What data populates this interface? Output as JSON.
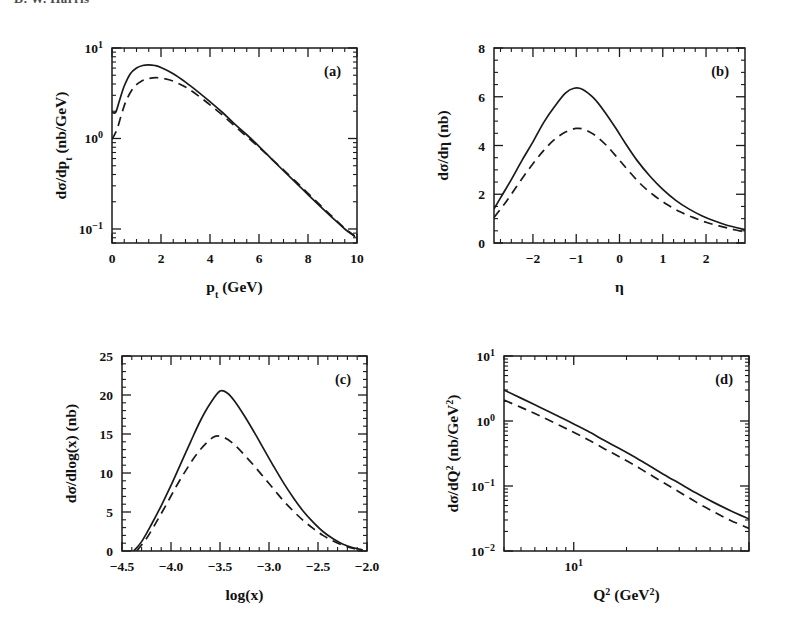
{
  "document": {
    "running_header": "D. W. Harris",
    "background_color": "#ffffff",
    "ink_color": "#1a1a1a"
  },
  "figure": {
    "panel_count": 4,
    "legend_note": "solid and dashed curves"
  },
  "chart_data": [
    {
      "id": "panel-a",
      "tag": "(a)",
      "type": "line",
      "title": "",
      "xlabel": "p_t (GeV)",
      "xlabel_parts": {
        "base": "p",
        "sub": "t",
        "unit": "(GeV)"
      },
      "ylabel": "dσ/dp_t (nb/GeV)",
      "ylabel_parts": {
        "base": "dσ/dp",
        "sub": "t",
        "unit": "(nb/GeV)"
      },
      "xscale": "linear",
      "yscale": "log",
      "xlim": [
        0,
        10
      ],
      "ylim": [
        0.07,
        10
      ],
      "xticks": [
        0,
        2,
        4,
        6,
        8,
        10
      ],
      "xticklabels": [
        "0",
        "2",
        "4",
        "6",
        "8",
        "10"
      ],
      "xminor_step": 0.5,
      "yticks": [
        10,
        1,
        0.1
      ],
      "yticklabels": [
        "10¹",
        "10⁰",
        "10⁻¹"
      ],
      "grid": false,
      "legend": "none",
      "series": [
        {
          "name": "solid",
          "style": "solid",
          "x": [
            0.0,
            0.15,
            0.3,
            0.5,
            0.75,
            1.0,
            1.25,
            1.5,
            1.75,
            2.0,
            2.5,
            3.0,
            3.5,
            4.0,
            4.5,
            5.0,
            5.5,
            6.0,
            6.5,
            7.0,
            7.5,
            8.0,
            8.5,
            9.0,
            9.5,
            9.9
          ],
          "y": [
            1.95,
            1.95,
            2.6,
            3.8,
            5.2,
            6.0,
            6.4,
            6.5,
            6.4,
            6.1,
            5.2,
            4.2,
            3.3,
            2.55,
            1.95,
            1.45,
            1.1,
            0.82,
            0.6,
            0.44,
            0.325,
            0.24,
            0.178,
            0.133,
            0.1,
            0.083
          ]
        },
        {
          "name": "dashed",
          "style": "dashed",
          "x": [
            0.0,
            0.2,
            0.4,
            0.6,
            0.9,
            1.2,
            1.5,
            1.8,
            2.1,
            2.5,
            3.0,
            3.5,
            4.0,
            4.5,
            5.0,
            5.5,
            6.0,
            6.5,
            7.0,
            7.5,
            8.0,
            8.5,
            9.0,
            9.5,
            9.9
          ],
          "y": [
            0.98,
            1.25,
            1.9,
            2.7,
            3.7,
            4.3,
            4.6,
            4.7,
            4.6,
            4.3,
            3.7,
            3.0,
            2.35,
            1.82,
            1.38,
            1.05,
            0.8,
            0.6,
            0.45,
            0.335,
            0.248,
            0.183,
            0.136,
            0.102,
            0.084
          ]
        }
      ]
    },
    {
      "id": "panel-b",
      "tag": "(b)",
      "type": "line",
      "title": "",
      "xlabel": "η",
      "ylabel": "dσ/dη (nb)",
      "xscale": "linear",
      "yscale": "linear",
      "xlim": [
        -2.9,
        2.9
      ],
      "ylim": [
        0,
        8
      ],
      "xticks": [
        -2,
        -1,
        0,
        1,
        2
      ],
      "xticklabels": [
        "-2",
        "-1",
        "0",
        "1",
        "2"
      ],
      "xminor_step": 0.25,
      "yticks": [
        0,
        2,
        4,
        6,
        8
      ],
      "yticklabels": [
        "0",
        "2",
        "4",
        "6",
        "8"
      ],
      "yminor_step": 0.5,
      "grid": false,
      "legend": "none",
      "series": [
        {
          "name": "solid",
          "style": "solid",
          "x": [
            -2.9,
            -2.7,
            -2.5,
            -2.25,
            -2.0,
            -1.75,
            -1.5,
            -1.25,
            -1.05,
            -0.85,
            -0.6,
            -0.35,
            -0.1,
            0.15,
            0.4,
            0.7,
            1.0,
            1.3,
            1.6,
            1.9,
            2.2,
            2.5,
            2.9
          ],
          "y": [
            1.4,
            2.0,
            2.6,
            3.4,
            4.15,
            4.95,
            5.6,
            6.15,
            6.35,
            6.3,
            5.95,
            5.4,
            4.75,
            4.05,
            3.4,
            2.75,
            2.2,
            1.75,
            1.4,
            1.12,
            0.9,
            0.72,
            0.55
          ]
        },
        {
          "name": "dashed",
          "style": "dashed",
          "x": [
            -2.9,
            -2.7,
            -2.5,
            -2.25,
            -2.0,
            -1.75,
            -1.5,
            -1.25,
            -1.0,
            -0.8,
            -0.55,
            -0.3,
            -0.05,
            0.2,
            0.5,
            0.8,
            1.1,
            1.4,
            1.7,
            2.0,
            2.3,
            2.6,
            2.9
          ],
          "y": [
            1.05,
            1.5,
            2.0,
            2.65,
            3.25,
            3.8,
            4.25,
            4.55,
            4.7,
            4.65,
            4.4,
            4.0,
            3.5,
            2.98,
            2.4,
            1.95,
            1.58,
            1.28,
            1.05,
            0.85,
            0.7,
            0.57,
            0.45
          ]
        }
      ]
    },
    {
      "id": "panel-c",
      "tag": "(c)",
      "type": "line",
      "title": "",
      "xlabel": "log(x)",
      "ylabel": "dσ/dlog(x) (nb)",
      "xscale": "linear",
      "yscale": "linear",
      "xlim": [
        -4.5,
        -2.0
      ],
      "ylim": [
        0,
        25
      ],
      "xticks": [
        -4.5,
        -4.0,
        -3.5,
        -3.0,
        -2.5,
        -2.0
      ],
      "xticklabels": [
        "-4.5",
        "-4.0",
        "-3.5",
        "-3.0",
        "-2.5",
        "-2.0"
      ],
      "xminor_step": 0.1,
      "yticks": [
        0,
        5,
        10,
        15,
        20,
        25
      ],
      "yticklabels": [
        "0",
        "5",
        "10",
        "15",
        "20",
        "25"
      ],
      "yminor_step": 1,
      "grid": false,
      "legend": "none",
      "series": [
        {
          "name": "solid",
          "style": "solid",
          "x": [
            -4.38,
            -4.3,
            -4.2,
            -4.1,
            -4.0,
            -3.9,
            -3.8,
            -3.7,
            -3.6,
            -3.5,
            -3.42,
            -3.35,
            -3.25,
            -3.15,
            -3.05,
            -2.95,
            -2.85,
            -2.75,
            -2.65,
            -2.55,
            -2.45,
            -2.35,
            -2.25,
            -2.15,
            -2.05
          ],
          "y": [
            0.0,
            1.2,
            3.4,
            5.8,
            8.4,
            11.2,
            14.0,
            16.7,
            18.9,
            20.5,
            20.2,
            19.2,
            17.3,
            15.2,
            13.0,
            10.8,
            8.7,
            6.8,
            5.1,
            3.7,
            2.5,
            1.6,
            0.9,
            0.45,
            0.15
          ]
        },
        {
          "name": "dashed",
          "style": "dashed",
          "x": [
            -4.35,
            -4.25,
            -4.15,
            -4.05,
            -3.95,
            -3.85,
            -3.75,
            -3.65,
            -3.55,
            -3.45,
            -3.35,
            -3.25,
            -3.15,
            -3.05,
            -2.95,
            -2.85,
            -2.75,
            -2.65,
            -2.55,
            -2.45,
            -2.35,
            -2.25,
            -2.15,
            -2.05
          ],
          "y": [
            0.0,
            1.6,
            3.7,
            5.9,
            8.2,
            10.3,
            12.2,
            13.7,
            14.7,
            14.5,
            13.6,
            12.3,
            10.9,
            9.4,
            7.9,
            6.4,
            5.1,
            3.9,
            2.9,
            2.0,
            1.3,
            0.75,
            0.35,
            0.1
          ]
        }
      ]
    },
    {
      "id": "panel-d",
      "tag": "(d)",
      "type": "line",
      "title": "",
      "xlabel": "Q² (GeV²)",
      "xlabel_parts": {
        "base": "Q",
        "sup": "2",
        "unit": "(GeV²)"
      },
      "ylabel": "dσ/dQ² (nb/GeV²)",
      "ylabel_parts": {
        "base": "dσ/dQ",
        "sup": "2",
        "unit": "(nb/GeV²)"
      },
      "xscale": "log",
      "yscale": "log",
      "xlim": [
        4,
        100
      ],
      "ylim": [
        0.01,
        10
      ],
      "xticks": [
        10
      ],
      "xticklabels": [
        "10¹"
      ],
      "yticks": [
        10,
        1,
        0.1,
        0.01
      ],
      "yticklabels": [
        "10¹",
        "10⁰",
        "10⁻¹",
        "10⁻²"
      ],
      "grid": false,
      "legend": "none",
      "series": [
        {
          "name": "solid",
          "style": "solid",
          "x": [
            4.0,
            5.0,
            6.0,
            7.0,
            8.5,
            10.0,
            12.0,
            15.0,
            18.0,
            22.0,
            27.0,
            33.0,
            40.0,
            50.0,
            62.0,
            78.0,
            100.0
          ],
          "y": [
            3.0,
            2.25,
            1.78,
            1.45,
            1.12,
            0.9,
            0.7,
            0.5,
            0.385,
            0.285,
            0.205,
            0.148,
            0.11,
            0.078,
            0.057,
            0.042,
            0.031
          ]
        },
        {
          "name": "dashed",
          "style": "dashed",
          "x": [
            4.0,
            5.0,
            6.0,
            7.0,
            8.5,
            10.0,
            12.0,
            15.0,
            18.0,
            22.0,
            27.0,
            33.0,
            40.0,
            50.0,
            62.0,
            78.0,
            100.0
          ],
          "y": [
            2.1,
            1.62,
            1.3,
            1.07,
            0.83,
            0.67,
            0.52,
            0.372,
            0.286,
            0.212,
            0.152,
            0.11,
            0.081,
            0.0565,
            0.041,
            0.0298,
            0.0222
          ]
        }
      ]
    }
  ]
}
